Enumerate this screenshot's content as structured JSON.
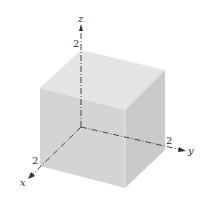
{
  "diagram": {
    "type": "3d-cube-in-coordinate-axes",
    "axes": {
      "x": {
        "label": "x",
        "tick_label": "2"
      },
      "y": {
        "label": "y",
        "tick_label": "2"
      },
      "z": {
        "label": "z",
        "tick_label": "2"
      }
    },
    "cube": {
      "side_length": 2,
      "colors": {
        "top": "#e3e3e3",
        "left": "#d2d2d2",
        "right": "#c9c9c9"
      }
    }
  }
}
